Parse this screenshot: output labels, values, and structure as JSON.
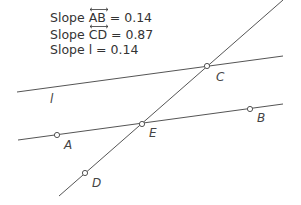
{
  "slopes": [
    {
      "prefix": "Slope ",
      "name": "AB",
      "overline": true,
      "suffix": " = 0.14"
    },
    {
      "prefix": "Slope ",
      "name": "CD",
      "overline": true,
      "suffix": " = 0.87"
    },
    {
      "prefix": "Slope ",
      "name": "l",
      "overline": false,
      "suffix": " = 0.14"
    }
  ],
  "labels": {
    "l": "l",
    "A": "A",
    "B": "B",
    "C": "C",
    "D": "D",
    "E": "E"
  },
  "colors": {
    "line": "#555555",
    "text": "#333333"
  }
}
